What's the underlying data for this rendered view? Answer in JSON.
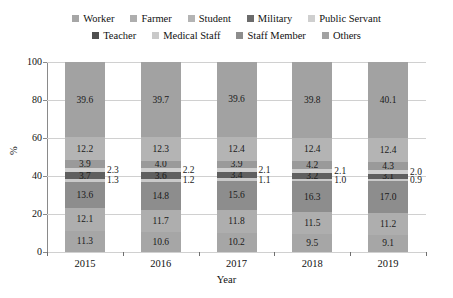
{
  "chart_data": {
    "type": "bar",
    "subtype": "stacked-100-percent",
    "title": "",
    "xlabel": "Year",
    "ylabel": "%",
    "ylim": [
      0,
      100
    ],
    "yticks": [
      0,
      20,
      40,
      60,
      80,
      100
    ],
    "grid": true,
    "legend_position": "top",
    "categories": [
      "2015",
      "2016",
      "2017",
      "2018",
      "2019"
    ],
    "stack_order_bottom_to_top": [
      "Worker",
      "Farmer",
      "Staff Member",
      "Medical Staff",
      "Teacher",
      "Public Servant",
      "Military",
      "Student",
      "Others"
    ],
    "series": [
      {
        "name": "Worker",
        "color": "#a6a6a6",
        "values": [
          11.3,
          10.6,
          10.2,
          9.5,
          9.1
        ],
        "label_placement": "inside"
      },
      {
        "name": "Farmer",
        "color": "#aeaeae",
        "values": [
          12.1,
          11.7,
          11.8,
          11.5,
          11.2
        ],
        "label_placement": "inside"
      },
      {
        "name": "Staff Member",
        "color": "#8d8d8d",
        "values": [
          13.6,
          14.8,
          15.6,
          16.3,
          17.0
        ],
        "label_placement": "inside"
      },
      {
        "name": "Medical Staff",
        "color": "#c9c9c9",
        "values": [
          1.3,
          1.2,
          1.1,
          1.0,
          0.9
        ],
        "label_placement": "outside"
      },
      {
        "name": "Teacher",
        "color": "#5f5f5f",
        "values": [
          3.7,
          3.6,
          3.4,
          3.2,
          3.1
        ],
        "label_placement": "inside"
      },
      {
        "name": "Public Servant",
        "color": "#cfcfcf",
        "values": [
          2.3,
          2.2,
          2.1,
          2.1,
          2.0
        ],
        "label_placement": "outside"
      },
      {
        "name": "Military",
        "color": "#9a9a9a",
        "values": [
          3.9,
          4.0,
          3.9,
          4.2,
          4.3
        ],
        "label_placement": "inside"
      },
      {
        "name": "Student",
        "color": "#b4b4b4",
        "values": [
          12.2,
          12.3,
          12.4,
          12.4,
          12.4
        ],
        "label_placement": "inside"
      },
      {
        "name": "Others",
        "color": "#a2a2a2",
        "values": [
          39.6,
          39.7,
          39.6,
          39.8,
          40.1
        ],
        "label_placement": "inside"
      }
    ]
  },
  "legend": {
    "rows": [
      [
        "Worker",
        "Farmer",
        "Student",
        "Military",
        "Public Servant"
      ],
      [
        "Teacher",
        "Medical Staff",
        "Staff Member",
        "Others"
      ]
    ],
    "swatch_colors": {
      "Worker": "#a6a6a6",
      "Farmer": "#aeaeae",
      "Student": "#b4b4b4",
      "Military": "#6b6b6b",
      "Public Servant": "#cfcfcf",
      "Teacher": "#4f4f4f",
      "Medical Staff": "#c9c9c9",
      "Staff Member": "#8d8d8d",
      "Others": "#a2a2a2"
    }
  }
}
